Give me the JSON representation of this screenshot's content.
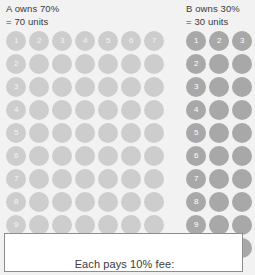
{
  "owner_a": {
    "title": "A owns 70%",
    "subtitle": "= 70 units",
    "columns": 7,
    "rows": 10,
    "total_units": 70,
    "dot_color": "#cdcdcd",
    "column_labels": [
      "1",
      "2",
      "3",
      "4",
      "5",
      "6",
      "7"
    ],
    "row_labels": [
      "1",
      "2",
      "3",
      "4",
      "5",
      "6",
      "7",
      "8",
      "9",
      "10"
    ]
  },
  "owner_b": {
    "title": "B owns 30%",
    "subtitle": "= 30 units",
    "columns": 3,
    "rows": 10,
    "total_units": 30,
    "dot_color": "#a8a8a8",
    "column_labels": [
      "1",
      "2",
      "3"
    ],
    "row_labels": [
      "1",
      "2",
      "3",
      "4",
      "5",
      "6",
      "7",
      "8",
      "9",
      "10"
    ]
  },
  "fee_callout": {
    "caption": "Each pays 10% fee:",
    "highlighted_row": "10",
    "border_color": "#8d8d8d",
    "background": "#ffffff"
  },
  "page": {
    "background": "#f2f2f2",
    "text_color": "#3b3b3b"
  }
}
